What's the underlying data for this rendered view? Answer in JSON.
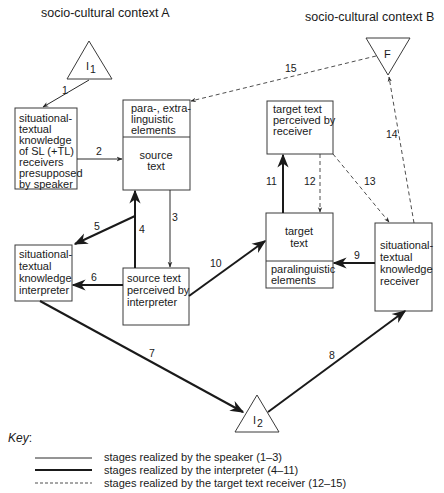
{
  "contexts": {
    "a": "socio-cultural context A",
    "b": "socio-cultural context B"
  },
  "nodes": {
    "i1": {
      "label": "I",
      "sub": "1"
    },
    "i2": {
      "label": "I",
      "sub": "2"
    },
    "f": {
      "label": "F"
    },
    "speaker_knowledge": {
      "lines": [
        "situational-",
        "textual",
        "knowledge",
        "of SL (+TL)",
        "receivers",
        "presupposed",
        "by speaker"
      ]
    },
    "source_text": {
      "top_lines": [
        "para-, extra-",
        "linguistic",
        "elements"
      ],
      "bottom_lines": [
        "source",
        "text"
      ]
    },
    "interpreter_knowledge": {
      "lines": [
        "situational-",
        "textual",
        "knowledge",
        "interpreter"
      ]
    },
    "source_perceived": {
      "lines": [
        "source text",
        "perceived by",
        "interpreter"
      ]
    },
    "target_perceived": {
      "lines": [
        "target text",
        "perceived by",
        "receiver"
      ]
    },
    "target_text": {
      "top_lines": [
        "target",
        "text"
      ],
      "bottom_lines": [
        "paralinguistic",
        "elements"
      ]
    },
    "receiver_knowledge": {
      "lines": [
        "situational-",
        "textual",
        "knowledge",
        "receiver"
      ]
    }
  },
  "edges": [
    {
      "n": "1",
      "style": "speaker"
    },
    {
      "n": "2",
      "style": "speaker"
    },
    {
      "n": "3",
      "style": "speaker"
    },
    {
      "n": "4",
      "style": "interpreter"
    },
    {
      "n": "5",
      "style": "interpreter"
    },
    {
      "n": "6",
      "style": "interpreter"
    },
    {
      "n": "7",
      "style": "interpreter"
    },
    {
      "n": "8",
      "style": "interpreter"
    },
    {
      "n": "9",
      "style": "interpreter"
    },
    {
      "n": "10",
      "style": "interpreter"
    },
    {
      "n": "11",
      "style": "interpreter"
    },
    {
      "n": "12",
      "style": "receiver"
    },
    {
      "n": "13",
      "style": "receiver"
    },
    {
      "n": "14",
      "style": "receiver"
    },
    {
      "n": "15",
      "style": "receiver"
    }
  ],
  "key": {
    "title": "Key",
    "colon": ":",
    "items": [
      {
        "style": "thin",
        "label": "stages realized by the speaker (1–3)"
      },
      {
        "style": "thick",
        "label": "stages realized by the interpreter (4–11)"
      },
      {
        "style": "dashed",
        "label": "stages realized by the target text receiver (12–15)"
      }
    ]
  }
}
